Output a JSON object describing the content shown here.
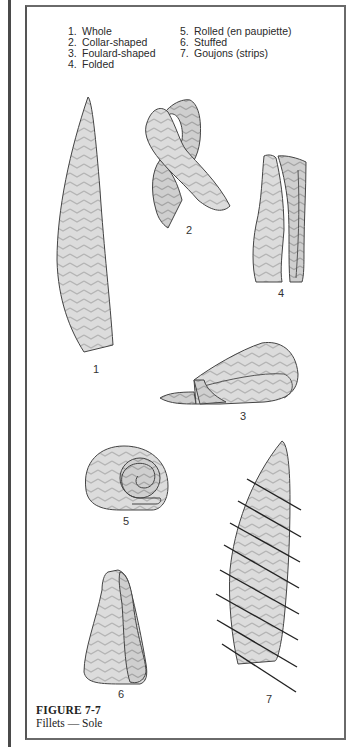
{
  "legend": {
    "column1": [
      {
        "num": "1.",
        "label": "Whole"
      },
      {
        "num": "2.",
        "label": "Collar-shaped"
      },
      {
        "num": "3.",
        "label": "Foulard-shaped"
      },
      {
        "num": "4.",
        "label": "Folded"
      }
    ],
    "column2": [
      {
        "num": "5.",
        "label": "Rolled (en paupiette)"
      },
      {
        "num": "6.",
        "label": "Stuffed"
      },
      {
        "num": "7.",
        "label": "Goujons (strips)"
      }
    ]
  },
  "figures": [
    {
      "id": "1",
      "label": "1",
      "name": "Whole"
    },
    {
      "id": "2",
      "label": "2",
      "name": "Collar-shaped"
    },
    {
      "id": "3",
      "label": "3",
      "name": "Foulard-shaped"
    },
    {
      "id": "4",
      "label": "4",
      "name": "Folded"
    },
    {
      "id": "5",
      "label": "5",
      "name": "Rolled (en paupiette)"
    },
    {
      "id": "6",
      "label": "6",
      "name": "Stuffed"
    },
    {
      "id": "7",
      "label": "7",
      "name": "Goujons (strips)"
    }
  ],
  "caption": {
    "figure_number": "FIGURE 7-7",
    "title": "Fillets — Sole"
  },
  "colors": {
    "ink": "#2a2a2a",
    "fill": "#d9d9d9",
    "frame": "#6a6a6a"
  }
}
